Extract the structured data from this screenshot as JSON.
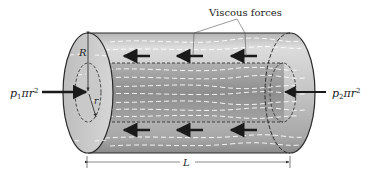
{
  "figure": {
    "title_label": "Viscous forces",
    "left_force_label": {
      "base": "p",
      "sub": "1",
      "rest": "πr",
      "sup": "2"
    },
    "right_force_label": {
      "base": "p",
      "sub": "2",
      "rest": "πr",
      "sup": "2"
    },
    "outer_radius_label": "R",
    "inner_radius_label": "r",
    "length_label": "L",
    "viscous_arrow_count_top": 3,
    "viscous_arrow_count_bottom": 3,
    "colors": {
      "outer_fill_light": "#d9d9d9",
      "outer_fill_dark": "#a8a8a8",
      "inner_fill": "#9a9a9a",
      "end_cap": "#c8c8c8",
      "streamline": "#ffffff",
      "arrow": "#1a1a1a",
      "outline": "#2a2a2a",
      "dim_line": "#555555"
    }
  }
}
